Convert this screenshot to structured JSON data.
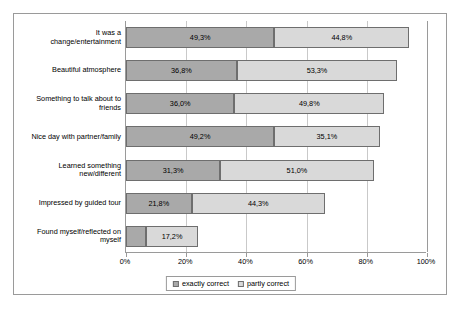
{
  "chart_data": {
    "type": "bar",
    "subtype": "stacked-horizontal",
    "title": "",
    "xlabel": "",
    "ylabel": "",
    "xlim": [
      0,
      100
    ],
    "grid": true,
    "legend_position": "bottom",
    "x_ticks": [
      "0%",
      "20%",
      "40%",
      "60%",
      "80%",
      "100%"
    ],
    "x_tick_values": [
      0,
      20,
      40,
      60,
      80,
      100
    ],
    "categories": [
      "It was a change/entertainment",
      "Beautiful atmosphere",
      "Something to talk about to friends",
      "Nice day with partner/family",
      "Learned something new/different",
      "Impressed by guided tour",
      "Found myself/reflected on myself"
    ],
    "category_lines": [
      [
        "It was a",
        "change/entertainment"
      ],
      [
        "Beautiful atmosphere"
      ],
      [
        "Something to talk about to",
        "friends"
      ],
      [
        "Nice day with partner/family"
      ],
      [
        "Learned something",
        "new/different"
      ],
      [
        "Impressed by guided tour"
      ],
      [
        "Found myself/reflected on",
        "myself"
      ]
    ],
    "series": [
      {
        "name": "exactly correct",
        "color": "#a9a9a9",
        "values": [
          49.3,
          36.8,
          36.0,
          49.2,
          31.3,
          21.8,
          6.7
        ],
        "labels": [
          "49,3%",
          "36,8%",
          "36,0%",
          "49,2%",
          "31,3%",
          "21,8%",
          "6,7%"
        ]
      },
      {
        "name": "partly correct",
        "color": "#d9d9d9",
        "values": [
          44.8,
          53.3,
          49.8,
          35.1,
          51.0,
          44.3,
          17.2
        ],
        "labels": [
          "44,8%",
          "53,3%",
          "49,8%",
          "35,1%",
          "51,0%",
          "44,3%",
          "17,2%"
        ]
      }
    ],
    "legend": [
      "exactly correct",
      "partly correct"
    ]
  }
}
